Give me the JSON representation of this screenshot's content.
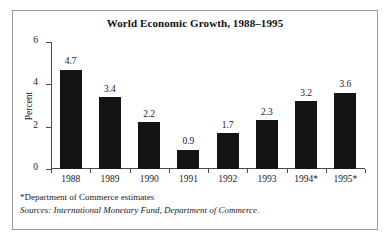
{
  "figure": {
    "title": "World Economic Growth, 1988–1995",
    "footnotes": {
      "estimates": "*Department of Commerce estimates",
      "sources": "Sources: International Monetary Fund, Department of Commerce."
    },
    "colors": {
      "bar": "#141414",
      "axis": "#4a4a4a",
      "border": "#9a9a9a",
      "background": "#ffffff",
      "text": "#1a1a1a"
    }
  },
  "chart_data": {
    "type": "bar",
    "title": "World Economic Growth, 1988–1995",
    "xlabel": "",
    "ylabel": "Percent",
    "categories": [
      "1988",
      "1989",
      "1990",
      "1991",
      "1992",
      "1993",
      "1994*",
      "1995*"
    ],
    "values": [
      4.7,
      3.4,
      2.2,
      0.9,
      1.7,
      2.3,
      3.2,
      3.6
    ],
    "value_labels": [
      "4.7",
      "3.4",
      "2.2",
      "0.9",
      "1.7",
      "2.3",
      "3.2",
      "3.6"
    ],
    "ylim": [
      0,
      6
    ],
    "yticks": [
      0,
      2,
      4,
      6
    ],
    "ytick_labels": [
      "0",
      "2",
      "4",
      "6"
    ],
    "grid": false,
    "legend": null,
    "annotations": [
      "*Department of Commerce estimates",
      "Sources: International Monetary Fund, Department of Commerce."
    ]
  }
}
